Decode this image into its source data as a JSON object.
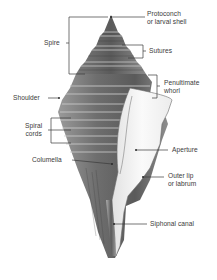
{
  "diagram": {
    "colors": {
      "background": "#ffffff",
      "leader_line": "#3a3a3a",
      "label_text": "#3a3a3a",
      "shell_dark": "#4a4a4a",
      "shell_mid": "#8a8a8a",
      "shell_light": "#d8d8d8",
      "aperture": "#f4f4f4"
    },
    "labels": {
      "protoconch_line1": "Protoconch",
      "protoconch_line2": "or larval shell",
      "spire": "Spire",
      "sutures": "Sutures",
      "penultimate_line1": "Penultimate",
      "penultimate_line2": "whorl",
      "shoulder": "Shoulder",
      "spiral_cords_line1": "Spiral",
      "spiral_cords_line2": "cords",
      "columella": "Columella",
      "aperture": "Aperture",
      "outer_lip_line1": "Outer lip",
      "outer_lip_line2": "or labrum",
      "siphonal_canal": "Siphonal canal"
    }
  }
}
